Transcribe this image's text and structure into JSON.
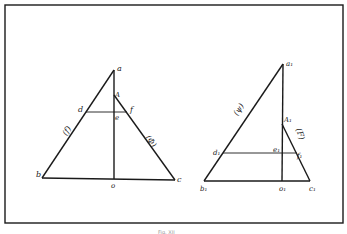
{
  "figure": {
    "caption": "Fig. XII",
    "frame": {
      "x": 5,
      "y": 5,
      "w": 338,
      "h": 218
    },
    "colors": {
      "line": "#1a1a1a",
      "background": "#ffffff"
    }
  },
  "left_triangle": {
    "labels": {
      "a": "a",
      "A": "A",
      "b": "b",
      "c": "c",
      "d": "d",
      "e": "e",
      "f": "f",
      "o": "o",
      "side_left": "(f)",
      "side_right": "(Φ)"
    }
  },
  "right_triangle": {
    "labels": {
      "a": "a₁",
      "A": "A₁",
      "b": "b₁",
      "c": "c₁",
      "d": "d₁",
      "e": "e₁",
      "f": "f₁",
      "o": "o₁",
      "side_left": "(ψ)",
      "side_right": "(F)"
    }
  }
}
